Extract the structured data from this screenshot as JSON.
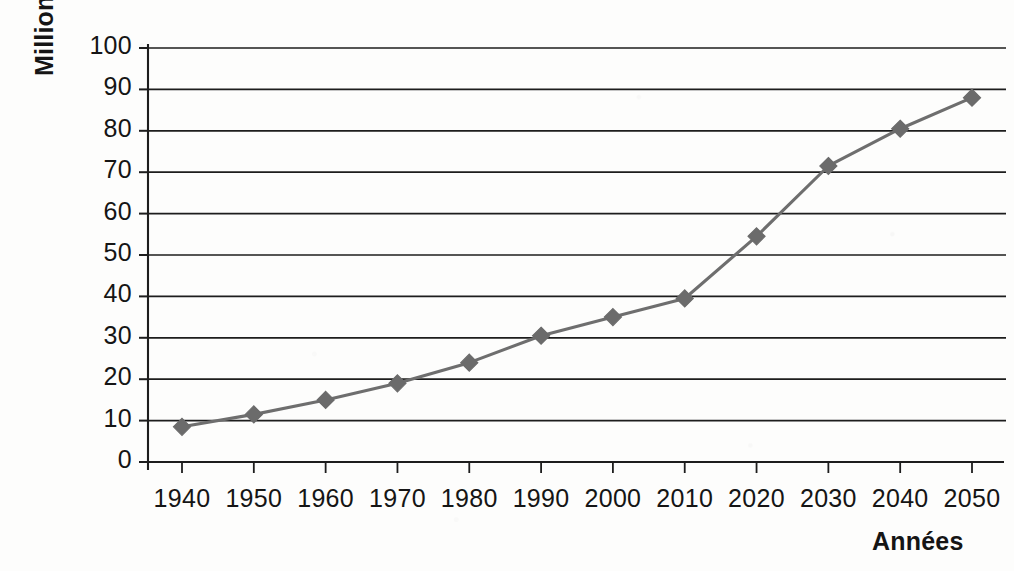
{
  "chart_data": {
    "type": "line",
    "title": "",
    "subtitle": "",
    "xlabel": "Années",
    "ylabel": "Millions",
    "x": [
      1940,
      1950,
      1960,
      1970,
      1980,
      1990,
      2000,
      2010,
      2020,
      2030,
      2040,
      2050
    ],
    "categories": [
      "1940",
      "1950",
      "1960",
      "1970",
      "1980",
      "1990",
      "2000",
      "2010",
      "2020",
      "2030",
      "2040",
      "2050"
    ],
    "values": [
      8.5,
      11.5,
      15,
      19,
      24,
      30.5,
      35,
      39.5,
      54.5,
      71.5,
      80.5,
      88
    ],
    "series": [
      {
        "name": "",
        "values": [
          8.5,
          11.5,
          15,
          19,
          24,
          30.5,
          35,
          39.5,
          54.5,
          71.5,
          80.5,
          88
        ]
      }
    ],
    "xlim": [
      1935,
      2055
    ],
    "ylim": [
      0,
      100
    ],
    "ytick_labels": [
      "100",
      "90",
      "80",
      "70",
      "60",
      "50",
      "40",
      "30",
      "20",
      "10",
      "0"
    ],
    "ytick_values": [
      100,
      90,
      80,
      70,
      60,
      50,
      40,
      30,
      20,
      10,
      0
    ],
    "ytick_step": 10,
    "grid": "horizontal",
    "legend": "none",
    "marker": "diamond",
    "annotations": []
  },
  "style": {
    "line_color": "#6e6e6e",
    "marker_color": "#6b6b6b",
    "grid_color": "#1d1d1d",
    "axis_color": "#1d1d1d",
    "text_color": "#151515",
    "background": "#fdfdfc"
  }
}
